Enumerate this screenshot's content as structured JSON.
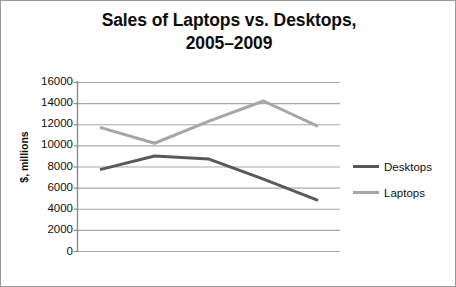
{
  "chart_data": {
    "type": "line",
    "title": "Sales of Laptops vs. Desktops, 2005–2009",
    "title_line1": "Sales of Laptops vs. Desktops,",
    "title_line2": "2005–2009",
    "xlabel": "",
    "ylabel": "$, millions",
    "x": [
      2005,
      2006,
      2007,
      2008,
      2009
    ],
    "categories": [
      "2005",
      "2006",
      "2007",
      "2008",
      "2009"
    ],
    "ylim": [
      0,
      16000
    ],
    "ytick_labels": [
      "16000",
      "14000",
      "12000",
      "10000",
      "8000",
      "6000",
      "4000",
      "2000",
      "0"
    ],
    "ytick_values": [
      16000,
      14000,
      12000,
      10000,
      8000,
      6000,
      4000,
      2000,
      0
    ],
    "grid": "horizontal",
    "xtick_labels_visible": false,
    "legend_position": "right",
    "series": [
      {
        "name": "Desktops",
        "values": [
          7700,
          9000,
          8700,
          6800,
          4800
        ],
        "color": "#595959",
        "line_width": 3
      },
      {
        "name": "Laptops",
        "values": [
          11700,
          10200,
          12300,
          14200,
          11800
        ],
        "color": "#a6a6a6",
        "line_width": 3
      }
    ]
  },
  "legend": {
    "items": [
      {
        "label": "Desktops",
        "color": "#595959"
      },
      {
        "label": "Laptops",
        "color": "#a6a6a6"
      }
    ]
  },
  "colors": {
    "frame_border": "#9a9a9a",
    "gridline": "#a9a9a9",
    "axis": "#8c8c8c",
    "text": "#0f0f0f",
    "background": "#ffffff"
  }
}
